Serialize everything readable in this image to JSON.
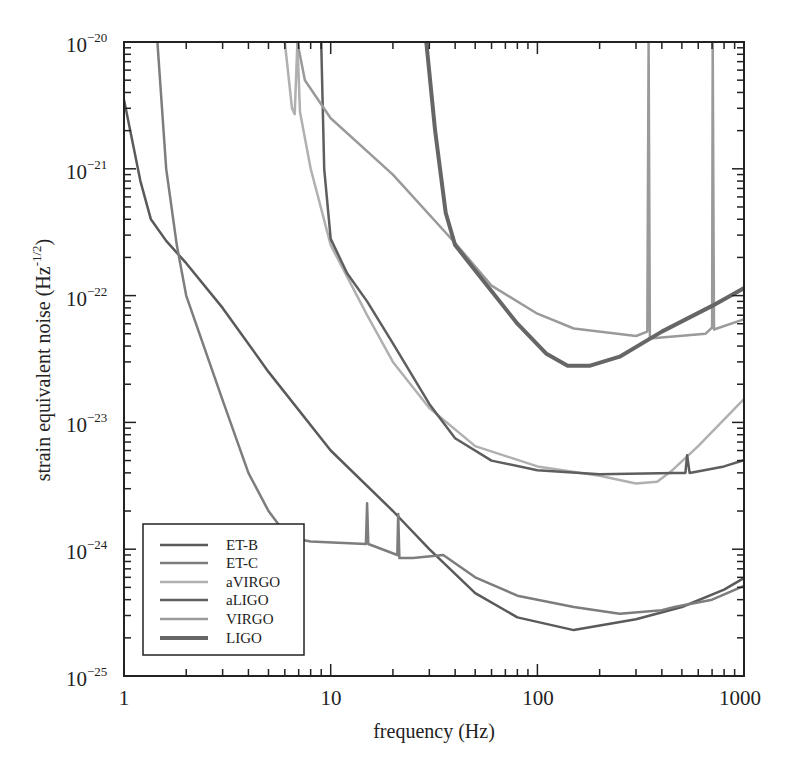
{
  "chart_data": {
    "type": "line",
    "title": "",
    "xlabel": "frequency (Hz)",
    "ylabel": "strain equivalent noise (Hz^-1/2)",
    "xscale": "log",
    "yscale": "log",
    "xlim": [
      1,
      1100
    ],
    "ylim": [
      1e-25,
      1e-20
    ],
    "grid": false,
    "legend_position": "lower left",
    "x_ticks": [
      "1",
      "10",
      "100",
      "1000"
    ],
    "y_ticks": [
      "10^-20",
      "10^-21",
      "10^-22",
      "10^-23",
      "10^-24",
      "10^-25"
    ],
    "series": [
      {
        "name": "ET-B",
        "color": "#5a5a5a",
        "width": 2.5,
        "points": [
          [
            1,
            3.5e-21
          ],
          [
            1.2,
            8e-22
          ],
          [
            1.35,
            4e-22
          ],
          [
            1.6,
            2.7e-22
          ],
          [
            2,
            1.8e-22
          ],
          [
            3,
            8e-23
          ],
          [
            5,
            2.5e-23
          ],
          [
            10,
            6e-24
          ],
          [
            20,
            2e-24
          ],
          [
            30,
            1e-24
          ],
          [
            50,
            4.5e-25
          ],
          [
            80,
            2.9e-25
          ],
          [
            150,
            2.3e-25
          ],
          [
            300,
            2.8e-25
          ],
          [
            500,
            3.5e-25
          ],
          [
            800,
            4.8e-25
          ],
          [
            1100,
            6.5e-25
          ]
        ]
      },
      {
        "name": "ET-C",
        "color": "#7d7d7d",
        "width": 2.5,
        "points": [
          [
            1.45,
            1e-20
          ],
          [
            1.6,
            1e-21
          ],
          [
            1.8,
            2.5e-22
          ],
          [
            2,
            1e-22
          ],
          [
            3,
            1.5e-23
          ],
          [
            4,
            4e-24
          ],
          [
            5,
            2e-24
          ],
          [
            6,
            1.35e-24
          ],
          [
            7,
            1.2e-24
          ],
          [
            8,
            1.15e-24
          ],
          [
            14.8,
            1.1e-24
          ],
          [
            15,
            2.3e-24
          ],
          [
            15.2,
            1.1e-24
          ],
          [
            21,
            9e-25
          ],
          [
            21.2,
            1.9e-24
          ],
          [
            21.5,
            8.5e-25
          ],
          [
            25,
            8.5e-25
          ],
          [
            35,
            9e-25
          ],
          [
            50,
            6e-25
          ],
          [
            80,
            4.3e-25
          ],
          [
            150,
            3.5e-25
          ],
          [
            250,
            3.1e-25
          ],
          [
            400,
            3.3e-25
          ],
          [
            460,
            3.5e-25
          ],
          [
            700,
            4e-25
          ],
          [
            1100,
            5.5e-25
          ]
        ]
      },
      {
        "name": "aVIRGO",
        "color": "#b0b0b0",
        "width": 2.5,
        "points": [
          [
            6,
            1e-20
          ],
          [
            6.5,
            3e-21
          ],
          [
            6.7,
            2.7e-21
          ],
          [
            6.9,
            1e-20
          ],
          [
            7.1,
            2.8e-21
          ],
          [
            8,
            1e-21
          ],
          [
            10,
            2.5e-22
          ],
          [
            15,
            7e-23
          ],
          [
            20,
            3e-23
          ],
          [
            30,
            1.3e-23
          ],
          [
            50,
            6.5e-24
          ],
          [
            100,
            4.5e-24
          ],
          [
            200,
            3.8e-24
          ],
          [
            300,
            3.3e-24
          ],
          [
            380,
            3.4e-24
          ],
          [
            450,
            4.2e-24
          ],
          [
            600,
            6.5e-24
          ],
          [
            1100,
            1.8e-23
          ]
        ]
      },
      {
        "name": "aLIGO",
        "color": "#5e5e5e",
        "width": 2.5,
        "points": [
          [
            9,
            1e-20
          ],
          [
            9.3,
            1e-21
          ],
          [
            10,
            2.8e-22
          ],
          [
            12,
            1.5e-22
          ],
          [
            15,
            9e-23
          ],
          [
            20,
            4.2e-23
          ],
          [
            30,
            1.4e-23
          ],
          [
            40,
            7.5e-24
          ],
          [
            60,
            5e-24
          ],
          [
            100,
            4.2e-24
          ],
          [
            200,
            3.9e-24
          ],
          [
            460,
            4e-24
          ],
          [
            520,
            4e-24
          ],
          [
            530,
            5.5e-24
          ],
          [
            545,
            4e-24
          ],
          [
            800,
            4.5e-24
          ],
          [
            1100,
            5.3e-24
          ]
        ]
      },
      {
        "name": "VIRGO",
        "color": "#9a9a9a",
        "width": 2.5,
        "points": [
          [
            6.9,
            1e-20
          ],
          [
            7.5,
            5e-21
          ],
          [
            10,
            2.5e-21
          ],
          [
            20,
            9e-22
          ],
          [
            40,
            2.6e-22
          ],
          [
            60,
            1.2e-22
          ],
          [
            100,
            7.2e-23
          ],
          [
            150,
            5.5e-23
          ],
          [
            300,
            4.8e-23
          ],
          [
            340,
            5.2e-23
          ],
          [
            345,
            1e-20
          ],
          [
            350,
            4.6e-23
          ],
          [
            650,
            5e-23
          ],
          [
            700,
            5.6e-23
          ],
          [
            705,
            1e-20
          ],
          [
            715,
            5.4e-23
          ],
          [
            1050,
            6.7e-23
          ],
          [
            1060,
            1e-20
          ],
          [
            1100,
            7e-23
          ]
        ]
      },
      {
        "name": "LIGO",
        "color": "#666666",
        "width": 4,
        "points": [
          [
            29,
            1e-20
          ],
          [
            32,
            2e-21
          ],
          [
            36,
            4.5e-22
          ],
          [
            40,
            2.5e-22
          ],
          [
            55,
            1.3e-22
          ],
          [
            80,
            6e-23
          ],
          [
            110,
            3.5e-23
          ],
          [
            140,
            2.8e-23
          ],
          [
            180,
            2.8e-23
          ],
          [
            250,
            3.3e-23
          ],
          [
            400,
            5.2e-23
          ],
          [
            700,
            8.3e-23
          ],
          [
            1100,
            1.25e-22
          ]
        ]
      }
    ]
  },
  "axes": {
    "xlabel": "frequency (Hz)",
    "ylabel_main": "strain equivalent noise (Hz",
    "ylabel_sup": "-1/2",
    "ylabel_close": ")",
    "x_ticks": [
      {
        "label": "1",
        "pos": 0
      },
      {
        "label": "10",
        "pos": 1
      },
      {
        "label": "100",
        "pos": 2
      },
      {
        "label": "1000",
        "pos": 3
      }
    ],
    "y_ticks": [
      {
        "base": "10",
        "exp": "−20"
      },
      {
        "base": "10",
        "exp": "−21"
      },
      {
        "base": "10",
        "exp": "−22"
      },
      {
        "base": "10",
        "exp": "−23"
      },
      {
        "base": "10",
        "exp": "−24"
      },
      {
        "base": "10",
        "exp": "−25"
      }
    ]
  },
  "legend": {
    "items": [
      "ET-B",
      "ET-C",
      "aVIRGO",
      "aLIGO",
      "VIRGO",
      "LIGO"
    ]
  }
}
